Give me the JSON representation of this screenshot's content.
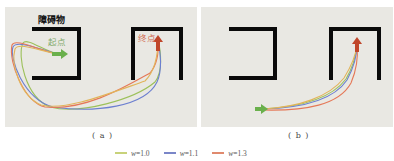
{
  "panels": [
    {
      "id": "a",
      "caption": "( a )",
      "labels": {
        "obstacle": "障碍物",
        "start": "起点",
        "goal": "终点"
      }
    },
    {
      "id": "b",
      "caption": "( b )"
    }
  ],
  "legend": [
    {
      "symbol": "w",
      "value": "=1.0",
      "color": "#c8d27a"
    },
    {
      "symbol": "w",
      "value": "=1.1",
      "color": "#7a86c8"
    },
    {
      "symbol": "w",
      "value": "=1.3",
      "color": "#e08a6e"
    }
  ],
  "colors": {
    "background": "#e9e8e3",
    "obstacle": "#0a0a0a",
    "start_arrow": "#6ab04c",
    "goal_arrow": "#c0462a",
    "start_label": "#7fa86a",
    "goal_label": "#d2694f",
    "path_green": "#9cc05a",
    "path_blue": "#6c7fd0",
    "path_red": "#e57858",
    "path_yellow": "#e2b45a"
  }
}
